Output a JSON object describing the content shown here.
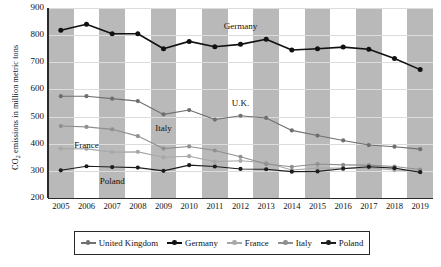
{
  "chart_data": {
    "type": "line",
    "title": "",
    "xlabel": "",
    "ylabel": "CO2 emissions in million metric tons",
    "ylabel_rich": "CO₂ emissions in million metric tons",
    "categories": [
      "2005",
      "2006",
      "2007",
      "2008",
      "2009",
      "2010",
      "2011",
      "2012",
      "2013",
      "2014",
      "2015",
      "2016",
      "2017",
      "2018",
      "2019"
    ],
    "x": [
      2005,
      2006,
      2007,
      2008,
      2009,
      2010,
      2011,
      2012,
      2013,
      2014,
      2015,
      2016,
      2017,
      2018,
      2019
    ],
    "ylim": [
      200,
      900
    ],
    "yticks": [
      900,
      800,
      700,
      600,
      500,
      400,
      300,
      200
    ],
    "ytick_labels": [
      "900",
      "800",
      "700",
      "600",
      "500",
      "400",
      "300",
      "200"
    ],
    "grid": true,
    "legend_position": "bottom",
    "series": [
      {
        "name": "United Kingdom",
        "color": "#6f6f6f",
        "values": [
          575,
          575,
          566,
          557,
          508,
          524,
          489,
          503,
          495,
          449,
          430,
          412,
          395,
          389,
          380
        ]
      },
      {
        "name": "Germany",
        "color": "#111111",
        "values": [
          818,
          840,
          805,
          805,
          750,
          777,
          757,
          766,
          785,
          745,
          750,
          756,
          748,
          714,
          673
        ]
      },
      {
        "name": "France",
        "color": "#a8a8a8",
        "values": [
          382,
          381,
          369,
          370,
          350,
          354,
          334,
          337,
          330,
          303,
          310,
          310,
          311,
          303,
          298
        ]
      },
      {
        "name": "Italy",
        "color": "#8f8f8f",
        "values": [
          465,
          462,
          453,
          428,
          382,
          390,
          375,
          352,
          325,
          315,
          325,
          322,
          321,
          316,
          305
        ]
      },
      {
        "name": "Poland",
        "color": "#1d1d1d",
        "values": [
          302,
          317,
          314,
          312,
          300,
          321,
          316,
          307,
          306,
          297,
          298,
          308,
          315,
          310,
          295
        ]
      }
    ],
    "annotations": [
      {
        "text": "Germany",
        "x": 2012,
        "y": 830
      },
      {
        "text": "U.K.",
        "x": 2012,
        "y": 545
      },
      {
        "text": "Italy",
        "x": 2009,
        "y": 455
      },
      {
        "text": "France",
        "x": 2006,
        "y": 390
      },
      {
        "text": "Poland",
        "x": 2007,
        "y": 258
      }
    ]
  },
  "legend": {
    "items": [
      {
        "label": "United Kingdom",
        "color": "#6f6f6f"
      },
      {
        "label": "Germany",
        "color": "#111111"
      },
      {
        "label": "France",
        "color": "#a8a8a8"
      },
      {
        "label": "Italy",
        "color": "#8f8f8f"
      },
      {
        "label": "Poland",
        "color": "#1d1d1d"
      }
    ]
  },
  "style": {
    "band_color": "#b9b9b9",
    "plot_background": "#ffffff",
    "grid_color": "#dcdcdc",
    "axis_color": "#2a2a2a"
  }
}
